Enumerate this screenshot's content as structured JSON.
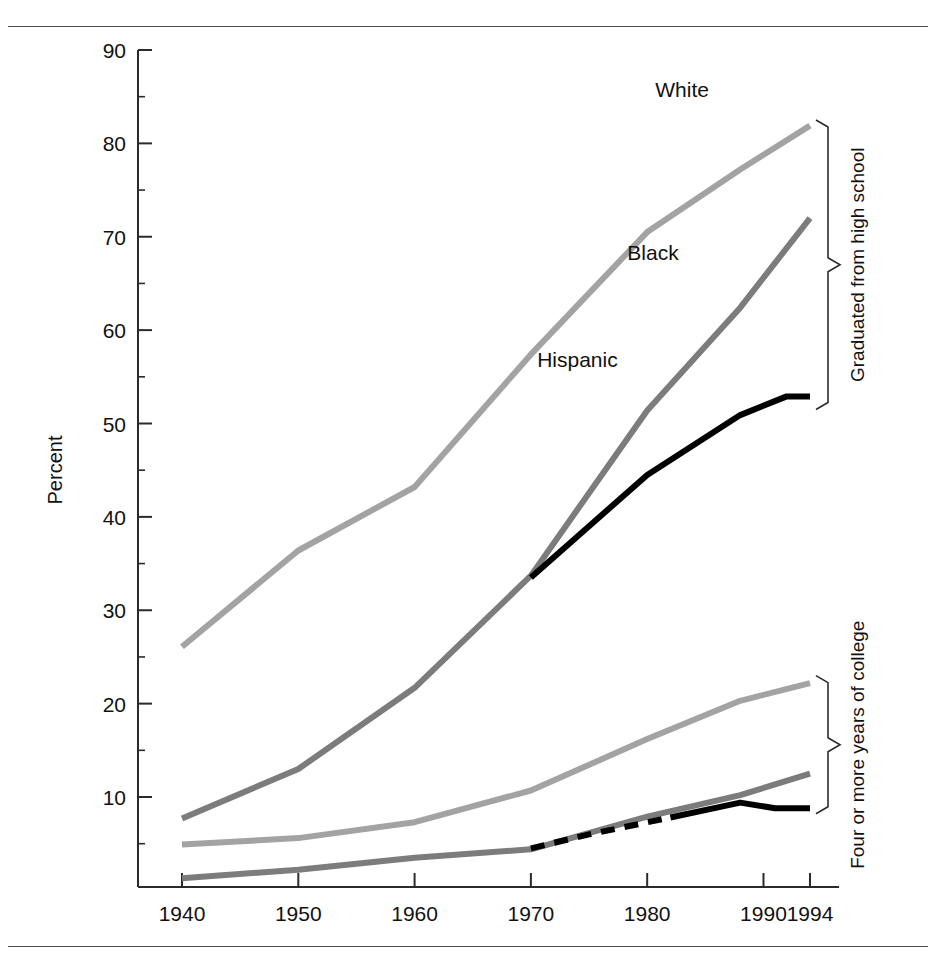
{
  "figure": {
    "y_axis_title": "Percent",
    "rules": [
      "top-rule",
      "bottom-rule"
    ]
  },
  "chart_data": {
    "type": "line",
    "title": "",
    "xlabel": "",
    "ylabel": "Percent",
    "xlim": [
      1936,
      1998
    ],
    "ylim": [
      0,
      90
    ],
    "grid": false,
    "legend": "inline-labels",
    "y_ticks_major": [
      10,
      20,
      30,
      40,
      50,
      60,
      70,
      80,
      90
    ],
    "y_ticks_minor": [
      5,
      15,
      25,
      35,
      45,
      55,
      65,
      75,
      85
    ],
    "y_tick_labels": [
      "10",
      "20",
      "30",
      "40",
      "50",
      "60",
      "70",
      "80",
      "90"
    ],
    "x_ticks": [
      1940,
      1950,
      1960,
      1970,
      1980,
      1990,
      1994
    ],
    "x_tick_labels": [
      "1940",
      "1950",
      "1960",
      "1970",
      "1980",
      "1990",
      "1994"
    ],
    "groups": [
      {
        "name": "Graduated from high school",
        "bracket_label": "Graduated from high school",
        "bracket_top_value": 82.5,
        "bracket_bottom_value": 51.5
      },
      {
        "name": "Four or more years of college",
        "bracket_label": "Four or more years of college",
        "bracket_top_value": 23.0,
        "bracket_bottom_value": 8.2
      }
    ],
    "series": [
      {
        "name": "White",
        "group": "Graduated from high school",
        "label": "White",
        "label_x": 1983,
        "label_y": 85,
        "color": "#a3a3a3",
        "width": 6,
        "dash": "none",
        "x": [
          1940,
          1950,
          1960,
          1970,
          1980,
          1988,
          1994
        ],
        "values": [
          26.1,
          36.4,
          43.2,
          57.4,
          70.5,
          77.2,
          81.9
        ]
      },
      {
        "name": "Black",
        "group": "Graduated from high school",
        "label": "Black",
        "label_x": 1980.5,
        "label_y": 67.5,
        "color": "#7c7c7c",
        "width": 6,
        "dash": "none",
        "x": [
          1940,
          1950,
          1960,
          1970,
          1980,
          1988,
          1994
        ],
        "values": [
          7.7,
          13.0,
          21.7,
          33.7,
          51.4,
          62.4,
          72.0
        ]
      },
      {
        "name": "Hispanic",
        "group": "Graduated from high school",
        "label": "Hispanic",
        "label_x": 1974,
        "label_y": 56,
        "color": "#000000",
        "width": 6,
        "dash": "none",
        "x": [
          1970,
          1980,
          1988,
          1992,
          1994
        ],
        "values": [
          33.5,
          44.5,
          50.9,
          52.9,
          52.9
        ]
      },
      {
        "name": "White",
        "group": "Four or more years of college",
        "label": "",
        "color": "#a3a3a3",
        "width": 6,
        "dash": "none",
        "x": [
          1940,
          1950,
          1960,
          1970,
          1980,
          1988,
          1994
        ],
        "values": [
          4.9,
          5.6,
          7.3,
          10.7,
          16.2,
          20.3,
          22.2
        ]
      },
      {
        "name": "Black",
        "group": "Four or more years of college",
        "label": "",
        "color": "#7c7c7c",
        "width": 6,
        "dash": "none",
        "x": [
          1940,
          1950,
          1960,
          1970,
          1980,
          1988,
          1994
        ],
        "values": [
          1.3,
          2.2,
          3.5,
          4.4,
          7.9,
          10.2,
          12.5
        ]
      },
      {
        "name": "Hispanic",
        "group": "Four or more years of college",
        "label": "",
        "color": "#000000",
        "width": 6,
        "dash": "14 10",
        "x": [
          1970,
          1975,
          1982
        ],
        "values": [
          4.5,
          6.0,
          7.8
        ]
      },
      {
        "name": "Hispanic",
        "group": "Four or more years of college",
        "label": "",
        "color": "#000000",
        "width": 6,
        "dash": "none",
        "x": [
          1982,
          1988,
          1991,
          1994
        ],
        "values": [
          7.8,
          9.4,
          8.8,
          8.8
        ]
      }
    ]
  }
}
